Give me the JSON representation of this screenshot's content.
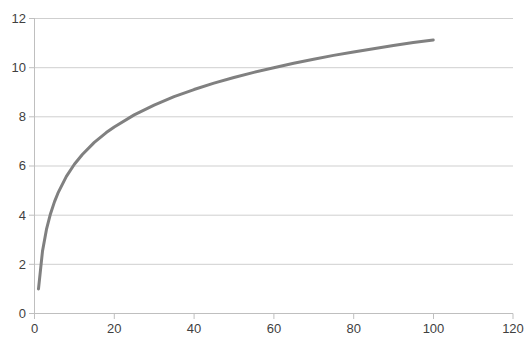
{
  "chart_data": {
    "type": "line",
    "title": "",
    "subtitle": "",
    "xlabel": "",
    "ylabel": "",
    "xlim": [
      0,
      120
    ],
    "ylim": [
      0,
      12
    ],
    "xticks": [
      0,
      20,
      40,
      60,
      80,
      100,
      120
    ],
    "yticks": [
      0,
      2,
      4,
      6,
      8,
      10,
      12
    ],
    "grid": "horizontal",
    "legend": "none",
    "series": [
      {
        "name": "curve",
        "color": "#808080",
        "x": [
          1,
          2,
          3,
          4,
          5,
          6,
          8,
          10,
          12,
          15,
          18,
          20,
          25,
          30,
          35,
          40,
          45,
          50,
          55,
          60,
          65,
          70,
          75,
          80,
          85,
          90,
          95,
          100
        ],
        "values": [
          1.0,
          2.53,
          3.42,
          4.05,
          4.54,
          4.94,
          5.58,
          6.07,
          6.47,
          6.96,
          7.36,
          7.59,
          8.08,
          8.48,
          8.82,
          9.11,
          9.37,
          9.6,
          9.81,
          10.0,
          10.18,
          10.34,
          10.5,
          10.64,
          10.77,
          10.9,
          11.02,
          11.13
        ]
      }
    ],
    "curve_note": "logarithmic-like increasing curve from (1,1) to (100,10)"
  },
  "axes": {
    "y_labels": [
      "12",
      "10",
      "8",
      "6",
      "4",
      "2",
      "0"
    ],
    "x_labels": [
      "0",
      "20",
      "40",
      "60",
      "80",
      "100",
      "120"
    ]
  },
  "colors": {
    "line": "#808080",
    "gridline": "#cfcfcf",
    "axis": "#bfbfbf",
    "text": "#3f3f3f",
    "background": "#ffffff"
  }
}
